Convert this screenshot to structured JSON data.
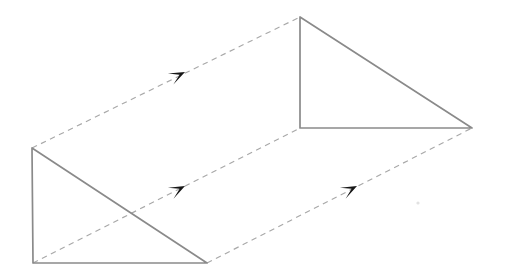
{
  "figure": {
    "background_color": "#ffffff",
    "width": 507,
    "height": 279,
    "solid_stroke_color": "#8a8a8a",
    "dashed_stroke_color": "#a8a8a8",
    "arrow_fill_color": "#161616"
  },
  "geometry": {
    "front_triangle": {
      "name": "front-triangle",
      "description": "Right triangle at lower left, vertical leg on left, horizontal leg on bottom",
      "vertices": [
        {
          "label": "front-top-left",
          "x": 32,
          "y": 148
        },
        {
          "label": "front-bottom-left",
          "x": 33,
          "y": 263
        },
        {
          "label": "front-bottom-right",
          "x": 207,
          "y": 263
        }
      ],
      "edges": [
        {
          "name": "front-vertical-leg",
          "from": "front-top-left",
          "to": "front-bottom-left",
          "style": "solid"
        },
        {
          "name": "front-horizontal-leg",
          "from": "front-bottom-left",
          "to": "front-bottom-right",
          "style": "solid"
        },
        {
          "name": "front-hypotenuse",
          "from": "front-top-left",
          "to": "front-bottom-right",
          "style": "solid"
        }
      ]
    },
    "back_triangle": {
      "name": "back-triangle",
      "description": "Right triangle at upper right, vertical leg on left, horizontal leg on bottom",
      "vertices": [
        {
          "label": "back-top-left",
          "x": 300,
          "y": 17
        },
        {
          "label": "back-bottom-left",
          "x": 300,
          "y": 128
        },
        {
          "label": "back-bottom-right",
          "x": 472,
          "y": 128
        }
      ],
      "edges": [
        {
          "name": "back-vertical-leg",
          "from": "back-top-left",
          "to": "back-bottom-left",
          "style": "solid"
        },
        {
          "name": "back-horizontal-leg",
          "from": "back-bottom-left",
          "to": "back-bottom-right",
          "style": "solid"
        },
        {
          "name": "back-hypotenuse",
          "from": "back-top-left",
          "to": "back-bottom-right",
          "style": "solid"
        }
      ]
    },
    "translation_vectors": [
      {
        "name": "translation-vector-top",
        "from": "front-top-left",
        "to": "back-top-left",
        "x1": 32,
        "y1": 148,
        "x2": 300,
        "y2": 17,
        "style": "dashed",
        "arrow": {
          "x": 185,
          "y": 72,
          "angle_deg": -26
        }
      },
      {
        "name": "translation-vector-middle",
        "from": "front-bottom-left",
        "to": "back-bottom-left",
        "x1": 33,
        "y1": 263,
        "x2": 300,
        "y2": 128,
        "style": "dashed",
        "arrow": {
          "x": 185,
          "y": 186,
          "angle_deg": -26.8
        }
      },
      {
        "name": "translation-vector-bottom",
        "from": "front-bottom-right",
        "to": "back-bottom-right",
        "x1": 207,
        "y1": 263,
        "x2": 472,
        "y2": 128,
        "style": "dashed",
        "arrow": {
          "x": 357,
          "y": 186,
          "angle_deg": -27
        }
      }
    ],
    "artifacts": [
      {
        "name": "scan-speck",
        "x": 418,
        "y": 203,
        "r": 1.6
      }
    ]
  }
}
